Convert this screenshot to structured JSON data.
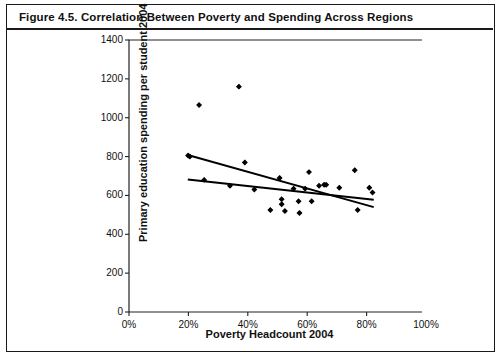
{
  "figure": {
    "title": "Figure 4.5.  Correlation Between Poverty and Spending Across Regions"
  },
  "chart_data": {
    "type": "scatter",
    "title": "Correlation Between Poverty and Spending Across Regions",
    "xlabel": "Poverty Headcount 2004",
    "ylabel": "Primary education spending per student 2004",
    "xlim": [
      0,
      100
    ],
    "ylim": [
      0,
      1400
    ],
    "xticks": [
      0,
      20,
      40,
      60,
      80,
      100
    ],
    "xtick_labels": [
      "0%",
      "20%",
      "40%",
      "60%",
      "80%",
      "100%"
    ],
    "yticks": [
      0,
      200,
      400,
      600,
      800,
      1000,
      1200,
      1400
    ],
    "ytick_labels": [
      "0",
      "200",
      "400",
      "600",
      "800",
      "1000",
      "1200",
      "1400"
    ],
    "grid": false,
    "legend": false,
    "marker_color": "#000000",
    "line_color": "#000000",
    "points": [
      {
        "x": 23.6,
        "y": 1065
      },
      {
        "x": 37.0,
        "y": 1160
      },
      {
        "x": 19.9,
        "y": 805
      },
      {
        "x": 20.5,
        "y": 800
      },
      {
        "x": 25.3,
        "y": 680
      },
      {
        "x": 39.0,
        "y": 770
      },
      {
        "x": 42.2,
        "y": 630
      },
      {
        "x": 34.0,
        "y": 650
      },
      {
        "x": 47.6,
        "y": 525
      },
      {
        "x": 50.7,
        "y": 690
      },
      {
        "x": 51.4,
        "y": 580
      },
      {
        "x": 51.4,
        "y": 555
      },
      {
        "x": 52.5,
        "y": 520
      },
      {
        "x": 55.4,
        "y": 635
      },
      {
        "x": 57.1,
        "y": 570
      },
      {
        "x": 57.4,
        "y": 510
      },
      {
        "x": 59.3,
        "y": 635
      },
      {
        "x": 60.6,
        "y": 720
      },
      {
        "x": 61.5,
        "y": 570
      },
      {
        "x": 64.0,
        "y": 650
      },
      {
        "x": 65.7,
        "y": 655
      },
      {
        "x": 66.4,
        "y": 655
      },
      {
        "x": 70.8,
        "y": 640
      },
      {
        "x": 76.0,
        "y": 730
      },
      {
        "x": 77.0,
        "y": 525
      },
      {
        "x": 80.9,
        "y": 640
      },
      {
        "x": 82.0,
        "y": 615
      }
    ],
    "trendlines": [
      {
        "name": "steep-regression-line",
        "x0": 19.8,
        "y0": 808,
        "x1": 82.4,
        "y1": 540
      },
      {
        "name": "shallow-regression-line",
        "x0": 19.8,
        "y0": 682,
        "x1": 82.4,
        "y1": 578
      }
    ]
  }
}
